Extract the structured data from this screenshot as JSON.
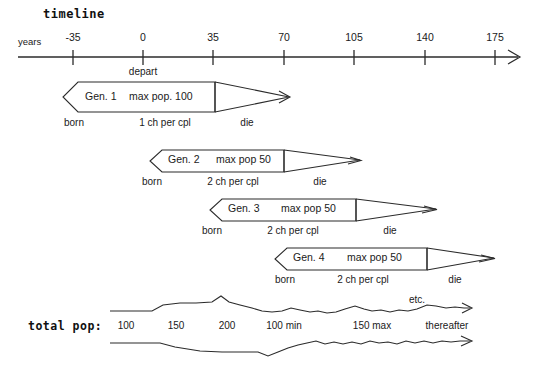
{
  "title": "timeline",
  "axis": {
    "caption": "years",
    "ticks": [
      {
        "label": "-35",
        "value": -35,
        "x": 73
      },
      {
        "label": "0",
        "value": 0,
        "x": 143
      },
      {
        "label": "35",
        "value": 35,
        "x": 213
      },
      {
        "label": "70",
        "value": 70,
        "x": 284
      },
      {
        "label": "105",
        "value": 105,
        "x": 354
      },
      {
        "label": "140",
        "value": 140,
        "x": 425
      },
      {
        "label": "175",
        "value": 175,
        "x": 495
      }
    ],
    "depart_label": "depart"
  },
  "generations": [
    {
      "name": "Gen. 1",
      "max_pop": "max pop. 100",
      "children": "1 ch per cpl",
      "born": "born",
      "die": "die"
    },
    {
      "name": "Gen. 2",
      "max_pop": "max pop 50",
      "children": "2 ch per cpl",
      "born": "born",
      "die": "die"
    },
    {
      "name": "Gen. 3",
      "max_pop": "max pop  50",
      "children": "2 ch per cpl",
      "born": "born",
      "die": "die"
    },
    {
      "name": "Gen. 4",
      "max_pop": "max pop  50",
      "children": "2 ch per cpl",
      "born": "born",
      "die": "die"
    }
  ],
  "total_pop": {
    "label": "total pop:",
    "etc_label": "etc.",
    "markers": [
      {
        "text": "100",
        "x": 126
      },
      {
        "text": "150",
        "x": 176
      },
      {
        "text": "200",
        "x": 227
      },
      {
        "text": "100 min",
        "x": 284
      },
      {
        "text": "150 max",
        "x": 372
      },
      {
        "text": "thereafter",
        "x": 447
      }
    ]
  },
  "colors": {
    "ink": "#1a1a1a",
    "line": "#2b2b2b",
    "background": "#ffffff"
  }
}
